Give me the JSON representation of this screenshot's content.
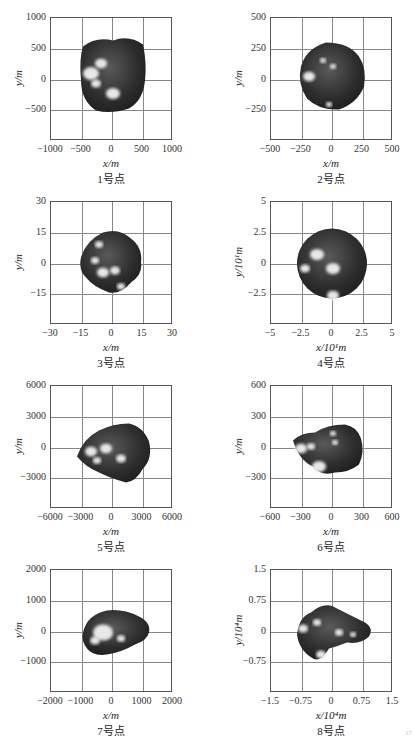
{
  "figure": {
    "panels": [
      {
        "caption": "1号点",
        "xlabel": "x/m",
        "ylabel": "y/m",
        "xticks": [
          "−1000",
          "−500",
          "0",
          "500",
          "1000"
        ],
        "yticks": [
          "1000",
          "500",
          "0",
          "−500",
          ""
        ]
      },
      {
        "caption": "2号点",
        "xlabel": "x/m",
        "ylabel": "y/m",
        "xticks": [
          "−500",
          "−250",
          "0",
          "250",
          "500"
        ],
        "yticks": [
          "500",
          "250",
          "0",
          "−250",
          ""
        ]
      },
      {
        "caption": "3号点",
        "xlabel": "x/m",
        "ylabel": "y/m",
        "xticks": [
          "−30",
          "−15",
          "0",
          "15",
          "30"
        ],
        "yticks": [
          "30",
          "15",
          "0",
          "−15",
          ""
        ]
      },
      {
        "caption": "4号点",
        "xlabel": "x/10¹m",
        "ylabel": "y/10¹m",
        "xticks": [
          "−5",
          "−2.5",
          "0",
          "2.5",
          "5"
        ],
        "yticks": [
          "5",
          "2.5",
          "0",
          "−2.5",
          ""
        ]
      },
      {
        "caption": "5号点",
        "xlabel": "x/m",
        "ylabel": "y/m",
        "xticks": [
          "−6000",
          "−3000",
          "0",
          "3000",
          "6000"
        ],
        "yticks": [
          "6000",
          "3000",
          "0",
          "−3000",
          ""
        ]
      },
      {
        "caption": "6号点",
        "xlabel": "x/m",
        "ylabel": "y/m",
        "xticks": [
          "−600",
          "−300",
          "0",
          "300",
          "600"
        ],
        "yticks": [
          "600",
          "300",
          "0",
          "−300",
          ""
        ]
      },
      {
        "caption": "7号点",
        "xlabel": "x/m",
        "ylabel": "y/m",
        "xticks": [
          "−2000",
          "−1000",
          "0",
          "1000",
          "2000"
        ],
        "yticks": [
          "2000",
          "1000",
          "0",
          "−1000",
          ""
        ]
      },
      {
        "caption": "8号点",
        "xlabel": "x/10⁴m",
        "ylabel": "y/10⁴m",
        "xticks": [
          "−1.5",
          "−0.75",
          "0",
          "0.75",
          "1.5"
        ],
        "yticks": [
          "1.5",
          "0.75",
          "0",
          "−0.75",
          ""
        ]
      }
    ],
    "page_mark": "17"
  },
  "chart_data": [
    {
      "type": "scatter",
      "title": "1号点",
      "xlabel": "x/m",
      "ylabel": "y/m",
      "xlim": [
        -1000,
        1000
      ],
      "ylim": [
        -1000,
        1000
      ],
      "grid": true,
      "x_ticks": [
        -1000,
        -500,
        0,
        500,
        1000
      ],
      "y_ticks": [
        -500,
        0,
        500,
        1000
      ],
      "shape": {
        "description": "asteroid silhouette",
        "x_extent": [
          -500,
          500
        ],
        "y_extent": [
          -450,
          480
        ]
      }
    },
    {
      "type": "scatter",
      "title": "2号点",
      "xlabel": "x/m",
      "ylabel": "y/m",
      "xlim": [
        -500,
        500
      ],
      "ylim": [
        -500,
        500
      ],
      "grid": true,
      "x_ticks": [
        -500,
        -250,
        0,
        250,
        500
      ],
      "y_ticks": [
        -250,
        0,
        250,
        500
      ],
      "shape": {
        "description": "asteroid silhouette",
        "x_extent": [
          -280,
          290
        ],
        "y_extent": [
          -260,
          270
        ]
      }
    },
    {
      "type": "scatter",
      "title": "3号点",
      "xlabel": "x/m",
      "ylabel": "y/m",
      "xlim": [
        -30,
        30
      ],
      "ylim": [
        -30,
        30
      ],
      "grid": true,
      "x_ticks": [
        -30,
        -15,
        0,
        15,
        30
      ],
      "y_ticks": [
        -15,
        0,
        15,
        30
      ],
      "shape": {
        "description": "asteroid silhouette",
        "x_extent": [
          -14,
          14
        ],
        "y_extent": [
          -14,
          14
        ]
      }
    },
    {
      "type": "scatter",
      "title": "4号点",
      "xlabel": "x/10¹m",
      "ylabel": "y/10¹m",
      "xlim": [
        -5,
        5
      ],
      "ylim": [
        -5,
        5
      ],
      "grid": true,
      "x_ticks": [
        -5,
        -2.5,
        0,
        2.5,
        5
      ],
      "y_ticks": [
        -2.5,
        0,
        2.5,
        5
      ],
      "shape": {
        "description": "near-spherical asteroid",
        "x_extent": [
          -2.9,
          2.9
        ],
        "y_extent": [
          -2.9,
          2.9
        ]
      }
    },
    {
      "type": "scatter",
      "title": "5号点",
      "xlabel": "x/m",
      "ylabel": "y/m",
      "xlim": [
        -6000,
        6000
      ],
      "ylim": [
        -6000,
        6000
      ],
      "grid": true,
      "x_ticks": [
        -6000,
        -3000,
        0,
        3000,
        6000
      ],
      "y_ticks": [
        -3000,
        0,
        3000,
        6000
      ],
      "shape": {
        "description": "asteroid silhouette",
        "x_extent": [
          -3700,
          3700
        ],
        "y_extent": [
          -3000,
          2800
        ]
      }
    },
    {
      "type": "scatter",
      "title": "6号点",
      "xlabel": "x/m",
      "ylabel": "y/m",
      "xlim": [
        -600,
        600
      ],
      "ylim": [
        -600,
        600
      ],
      "grid": true,
      "x_ticks": [
        -600,
        -300,
        0,
        300,
        600
      ],
      "y_ticks": [
        -300,
        0,
        300,
        600
      ],
      "shape": {
        "description": "asteroid silhouette",
        "x_extent": [
          -360,
          300
        ],
        "y_extent": [
          -270,
          210
        ]
      }
    },
    {
      "type": "scatter",
      "title": "7号点",
      "xlabel": "x/m",
      "ylabel": "y/m",
      "xlim": [
        -2000,
        2000
      ],
      "ylim": [
        -2000,
        2000
      ],
      "grid": true,
      "x_ticks": [
        -2000,
        -1000,
        0,
        1000,
        2000
      ],
      "y_ticks": [
        -1000,
        0,
        1000,
        2000
      ],
      "shape": {
        "description": "asteroid silhouette",
        "x_extent": [
          -900,
          1100
        ],
        "y_extent": [
          -700,
          700
        ]
      }
    },
    {
      "type": "scatter",
      "title": "8号点",
      "xlabel": "x/10⁴m",
      "ylabel": "y/10⁴m",
      "xlim": [
        -1.5,
        1.5
      ],
      "ylim": [
        -1.5,
        1.5
      ],
      "grid": true,
      "x_ticks": [
        -1.5,
        -0.75,
        0,
        0.75,
        1.5
      ],
      "y_ticks": [
        -0.75,
        0,
        0.75,
        1.5
      ],
      "shape": {
        "description": "asteroid silhouette",
        "x_extent": [
          -0.75,
          1.0
        ],
        "y_extent": [
          -0.65,
          0.6
        ]
      }
    }
  ]
}
